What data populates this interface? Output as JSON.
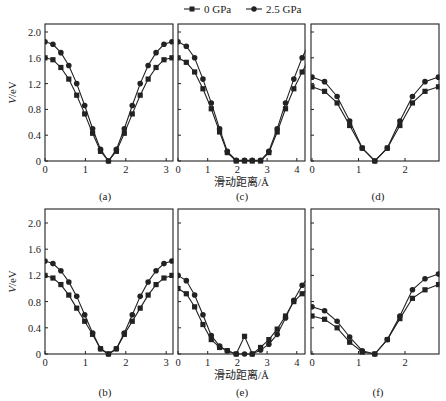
{
  "legend": {
    "items": [
      {
        "label": "0 GPa",
        "marker": "square"
      },
      {
        "label": "2.5 GPa",
        "marker": "circle"
      }
    ]
  },
  "axes": {
    "ylabel": "V/eV",
    "xlabel": "滑动距离/Å",
    "yticks": [
      "0",
      "0.4",
      "0.8",
      "1.2",
      "1.6",
      "2.0"
    ]
  },
  "chart_data": [
    {
      "panel": "(a)",
      "type": "line",
      "xlabel": "",
      "ylabel": "V/eV",
      "xlim": [
        0,
        3.2
      ],
      "ylim": [
        0,
        2.2
      ],
      "xticks": [
        0,
        1,
        2,
        3
      ],
      "x": [
        0,
        0.196,
        0.393,
        0.589,
        0.785,
        0.982,
        1.178,
        1.374,
        1.571,
        1.767,
        1.963,
        2.16,
        2.356,
        2.553,
        2.749,
        2.945,
        3.142
      ],
      "series": [
        {
          "name": "0 GPa",
          "marker": "square",
          "values": [
            1.6,
            1.57,
            1.45,
            1.27,
            1.02,
            0.73,
            0.43,
            0.15,
            0.0,
            0.15,
            0.43,
            0.73,
            1.02,
            1.27,
            1.45,
            1.57,
            1.6
          ]
        },
        {
          "name": "2.5 GPa",
          "marker": "circle",
          "values": [
            1.85,
            1.81,
            1.68,
            1.48,
            1.2,
            0.86,
            0.5,
            0.18,
            0.0,
            0.18,
            0.5,
            0.86,
            1.2,
            1.48,
            1.68,
            1.81,
            1.85
          ]
        }
      ]
    },
    {
      "panel": "(c)",
      "type": "line",
      "xlabel": "滑动距离/Å",
      "ylabel": "",
      "xlim": [
        0,
        4.27
      ],
      "ylim": [
        0,
        2.2
      ],
      "xticks": [
        0,
        1,
        2,
        3,
        4
      ],
      "x": [
        0,
        0.28,
        0.56,
        0.84,
        1.12,
        1.4,
        1.66,
        1.96,
        2.24,
        2.5,
        2.78,
        3.06,
        3.34,
        3.62,
        3.9,
        4.18,
        4.44
      ],
      "series": [
        {
          "name": "0 GPa",
          "marker": "square",
          "values": [
            1.6,
            1.53,
            1.38,
            1.12,
            0.81,
            0.45,
            0.13,
            0.0,
            0.0,
            0.0,
            0.0,
            0.13,
            0.45,
            0.81,
            1.12,
            1.38,
            1.6
          ]
        },
        {
          "name": "2.5 GPa",
          "marker": "circle",
          "values": [
            1.85,
            1.78,
            1.6,
            1.27,
            0.9,
            0.5,
            0.15,
            0.01,
            0.01,
            0.01,
            0.01,
            0.15,
            0.5,
            0.9,
            1.27,
            1.6,
            1.85
          ]
        }
      ]
    },
    {
      "panel": "(d)",
      "type": "line",
      "xlabel": "",
      "ylabel": "",
      "xlim": [
        0,
        2.72
      ],
      "ylim": [
        0,
        2.2
      ],
      "xticks": [
        0,
        1,
        2
      ],
      "x": [
        0,
        0.27,
        0.54,
        0.81,
        1.08,
        1.35,
        1.62,
        1.89,
        2.16,
        2.43,
        2.72
      ],
      "series": [
        {
          "name": "0 GPa",
          "marker": "square",
          "values": [
            1.15,
            1.08,
            0.9,
            0.55,
            0.2,
            0.0,
            0.2,
            0.55,
            0.9,
            1.08,
            1.15
          ]
        },
        {
          "name": "2.5 GPa",
          "marker": "circle",
          "values": [
            1.3,
            1.23,
            1.0,
            0.62,
            0.2,
            0.0,
            0.2,
            0.62,
            1.0,
            1.23,
            1.3
          ]
        }
      ]
    },
    {
      "panel": "(b)",
      "type": "line",
      "xlabel": "",
      "ylabel": "V/eV",
      "xlim": [
        0,
        3.2
      ],
      "ylim": [
        0,
        2.2
      ],
      "xticks": [
        0,
        1,
        2,
        3
      ],
      "x": [
        0,
        0.196,
        0.393,
        0.589,
        0.785,
        0.982,
        1.178,
        1.374,
        1.571,
        1.767,
        1.963,
        2.16,
        2.356,
        2.553,
        2.749,
        2.945,
        3.142
      ],
      "series": [
        {
          "name": "0 GPa",
          "marker": "square",
          "values": [
            1.2,
            1.16,
            1.06,
            0.9,
            0.7,
            0.5,
            0.3,
            0.08,
            0.0,
            0.08,
            0.3,
            0.5,
            0.7,
            0.9,
            1.06,
            1.16,
            1.2
          ]
        },
        {
          "name": "2.5 GPa",
          "marker": "circle",
          "values": [
            1.42,
            1.38,
            1.27,
            1.1,
            0.88,
            0.6,
            0.32,
            0.08,
            0.0,
            0.08,
            0.32,
            0.6,
            0.88,
            1.1,
            1.27,
            1.38,
            1.42
          ]
        }
      ]
    },
    {
      "panel": "(e)",
      "type": "line",
      "xlabel": "滑动距离/Å",
      "ylabel": "",
      "xlim": [
        0,
        4.27
      ],
      "ylim": [
        0,
        2.2
      ],
      "xticks": [
        0,
        1,
        2,
        3,
        4
      ],
      "x": [
        0,
        0.28,
        0.56,
        0.84,
        1.12,
        1.4,
        1.66,
        1.96,
        2.24,
        2.5,
        2.78,
        3.06,
        3.34,
        3.62,
        3.9,
        4.18,
        4.44
      ],
      "series": [
        {
          "name": "0 GPa",
          "marker": "square",
          "values": [
            1.0,
            0.92,
            0.72,
            0.45,
            0.22,
            0.1,
            0.05,
            0.0,
            0.27,
            0.0,
            0.1,
            0.22,
            0.38,
            0.58,
            0.8,
            0.92,
            1.0
          ]
        },
        {
          "name": "2.5 GPa",
          "marker": "circle",
          "values": [
            1.2,
            1.12,
            0.9,
            0.6,
            0.28,
            0.12,
            0.05,
            0.0,
            0.0,
            0.0,
            0.06,
            0.15,
            0.3,
            0.55,
            0.82,
            1.05,
            1.2
          ]
        }
      ]
    },
    {
      "panel": "(f)",
      "type": "line",
      "xlabel": "",
      "ylabel": "",
      "xlim": [
        0,
        2.72
      ],
      "ylim": [
        0,
        2.2
      ],
      "xticks": [
        0,
        1,
        2
      ],
      "x": [
        0,
        0.27,
        0.54,
        0.81,
        1.08,
        1.35,
        1.62,
        1.89,
        2.16,
        2.43,
        2.72
      ],
      "series": [
        {
          "name": "0 GPa",
          "marker": "square",
          "values": [
            0.58,
            0.53,
            0.4,
            0.18,
            0.03,
            0.0,
            0.22,
            0.54,
            0.85,
            0.98,
            1.06
          ]
        },
        {
          "name": "2.5 GPa",
          "marker": "circle",
          "values": [
            0.72,
            0.66,
            0.5,
            0.26,
            0.05,
            0.0,
            0.22,
            0.58,
            0.98,
            1.15,
            1.22
          ]
        }
      ]
    }
  ]
}
